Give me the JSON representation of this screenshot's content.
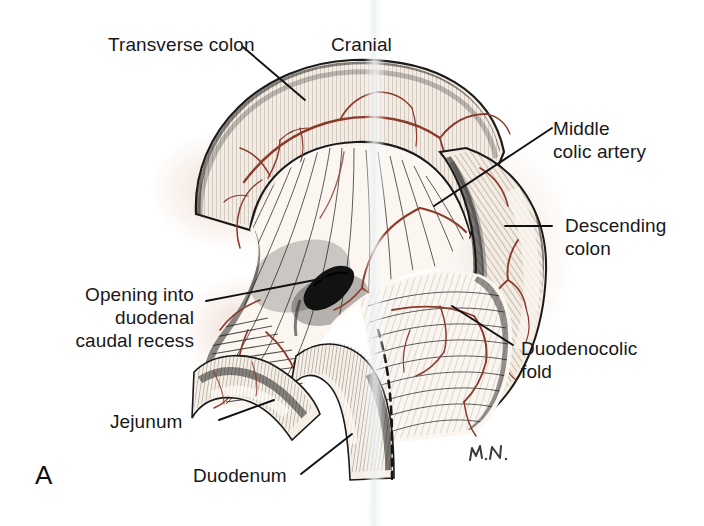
{
  "figure": {
    "panel_letter": "A",
    "artist_signature": "M.N.",
    "orientation_label": "Cranial",
    "background_color": "#ffffff",
    "tissue_color": "#f4ebe1",
    "vessel_color": "#8b3a2a",
    "ink_color": "#1a1a1a",
    "label_color": "#18181a"
  },
  "labels": {
    "transverse_colon": "Transverse colon",
    "cranial": "Cranial",
    "middle_colic_artery_l1": "Middle",
    "middle_colic_artery_l2": "colic artery",
    "descending_colon_l1": "Descending",
    "descending_colon_l2": "colon",
    "duodenocolic_fold_l1": "Duodenocolic",
    "duodenocolic_fold_l2": "fold",
    "opening_l1": "Opening into",
    "opening_l2": "duodenal",
    "opening_l3": "caudal recess",
    "jejunum": "Jejunum",
    "duodenum": "Duodenum"
  }
}
